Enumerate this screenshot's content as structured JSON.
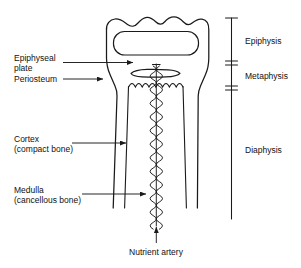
{
  "figure": {
    "type": "anatomical-diagram",
    "background_color": "#ffffff",
    "line_color": "#1a1a1a"
  },
  "labels_left": [
    {
      "id": "epiphyseal-plate",
      "line1": "Epiphyseal",
      "line2": "plate"
    },
    {
      "id": "periosteum",
      "line1": "Periosteum",
      "line2": ""
    },
    {
      "id": "cortex",
      "line1": "Cortex",
      "line2": "(compact bone)"
    },
    {
      "id": "medulla",
      "line1": "Medulla",
      "line2": "(cancellous bone)"
    }
  ],
  "labels_right": [
    {
      "id": "epiphysis",
      "text": "Epiphysis"
    },
    {
      "id": "metaphysis",
      "text": "Metaphysis"
    },
    {
      "id": "diaphysis",
      "text": "Diaphysis"
    }
  ],
  "labels_bottom": [
    {
      "id": "nutrient-artery",
      "text": "Nutrient artery"
    }
  ],
  "regions_bracket": {
    "epiphysis_span": "top of bone to epiphyseal plate",
    "metaphysis_span": "epiphyseal plate to flared shaft",
    "diaphysis_span": "shaft of bone"
  }
}
